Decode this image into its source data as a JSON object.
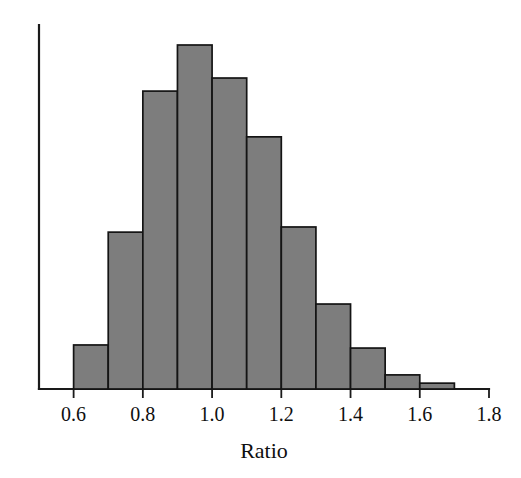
{
  "chart_data": {
    "type": "bar",
    "title": "",
    "subtitle": "",
    "xlabel": "Ratio",
    "ylabel": "",
    "grid": false,
    "legend": "none",
    "orientation": "vertical",
    "histogram": true,
    "bin_width": 0.1,
    "xlim": [
      0.5,
      1.8
    ],
    "ylim": [
      0,
      1.0
    ],
    "xticks": [
      0.6,
      0.8,
      1.0,
      1.2,
      1.4,
      1.6,
      1.8
    ],
    "xtick_labels": [
      "0.6",
      "0.8",
      "1.0",
      "1.2",
      "1.4",
      "1.6",
      "1.8"
    ],
    "yticks": [],
    "ytick_labels": [],
    "bin_edges": [
      0.6,
      0.7,
      0.8,
      0.9,
      1.0,
      1.1,
      1.2,
      1.3,
      1.4,
      1.5,
      1.6,
      1.7
    ],
    "categories": [
      "0.6-0.7",
      "0.7-0.8",
      "0.8-0.9",
      "0.9-1.0",
      "1.0-1.1",
      "1.1-1.2",
      "1.2-1.3",
      "1.3-1.4",
      "1.4-1.5",
      "1.5-1.6",
      "1.6-1.7"
    ],
    "values": [
      0.128,
      0.456,
      0.866,
      1.0,
      0.904,
      0.733,
      0.471,
      0.247,
      0.119,
      0.041,
      0.017
    ],
    "bar_color": "#7d7d7d",
    "bar_edge_color": "#141414",
    "axis_color": "#1a1a1a",
    "annotations": []
  },
  "axis": {
    "x_title": "Ratio"
  }
}
